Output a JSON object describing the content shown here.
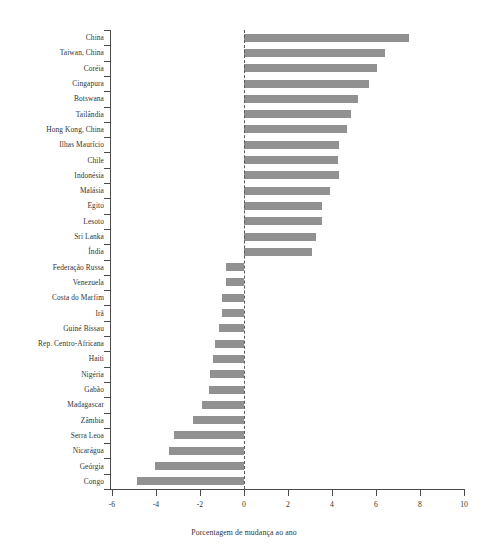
{
  "chart_data": {
    "type": "bar",
    "orientation": "horizontal",
    "title": "",
    "xlabel": "Porcentagem de mudança ao ano",
    "ylabel": "",
    "xlim": [
      -6,
      10
    ],
    "ylim": null,
    "grid": false,
    "legend": null,
    "zero_reference_line": true,
    "bar_color": "#919191",
    "axis_color": "#4a4a4a",
    "xticks": [
      -6,
      -4,
      -2,
      0,
      2,
      4,
      6,
      8,
      10
    ],
    "xtick_labels": [
      "-6",
      "-4",
      "-2",
      "0",
      "2",
      "4",
      "6",
      "8",
      "10"
    ],
    "categories": [
      "China",
      "Taiwan, China",
      "Coréia",
      "Cingapura",
      "Botswana",
      "Tailândia",
      "Hong Kong, China",
      "Ilhas Maurício",
      "Chile",
      "Indonésia",
      "Malásia",
      "Egito",
      "Lesoto",
      "Sri Lanka",
      "Índia",
      "Federação Russa",
      "Venezuela",
      "Costa do Marfim",
      "Irã",
      "Guiné Bissau",
      "Rep. Centro-Africana",
      "Haiti",
      "Nigéria",
      "Gabão",
      "Madagascar",
      "Zâmbia",
      "Serra Leoa",
      "Nicarágua",
      "Geórgia",
      "Congo"
    ],
    "values": [
      7.5,
      6.4,
      6.05,
      5.7,
      5.2,
      4.85,
      4.7,
      4.3,
      4.25,
      4.3,
      3.9,
      3.55,
      3.55,
      3.25,
      3.1,
      -0.8,
      -0.8,
      -1.0,
      -1.0,
      -1.15,
      -1.3,
      -1.4,
      -1.55,
      -1.6,
      -1.9,
      -2.3,
      -3.2,
      -3.4,
      -4.05,
      -4.85
    ]
  }
}
